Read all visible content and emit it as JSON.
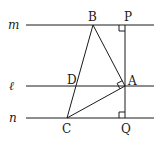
{
  "diagram": {
    "lines": [
      {
        "label": "m",
        "y": 25
      },
      {
        "label": "ℓ",
        "y": 86
      },
      {
        "label": "n",
        "y": 118
      }
    ],
    "points": {
      "B": {
        "label": "B",
        "x": 93,
        "y": 25
      },
      "P": {
        "label": "P",
        "x": 125,
        "y": 25
      },
      "A": {
        "label": "A",
        "x": 125,
        "y": 86
      },
      "D": {
        "label": "D",
        "x": 76,
        "y": 86
      },
      "C": {
        "label": "C",
        "x": 67,
        "y": 118
      },
      "Q": {
        "label": "Q",
        "x": 125,
        "y": 118
      }
    },
    "segments": [
      "BC",
      "BA",
      "AC",
      "PQ"
    ],
    "right_angles": [
      "P",
      "A",
      "Q"
    ],
    "colors": {
      "stroke": "#1a1a1a",
      "background": "#ffffff"
    }
  }
}
